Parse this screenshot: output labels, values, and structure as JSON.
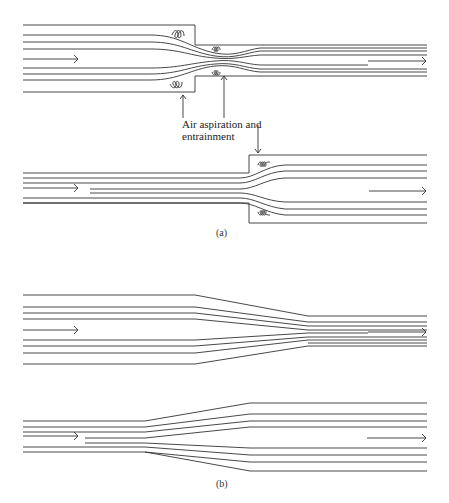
{
  "figure": {
    "annotation": [
      "Air aspiration and",
      "entrainment"
    ],
    "panel_a_label": "(a)",
    "panel_b_label": "(b)"
  },
  "colors": {
    "line": "#333333",
    "background": "#ffffff"
  }
}
